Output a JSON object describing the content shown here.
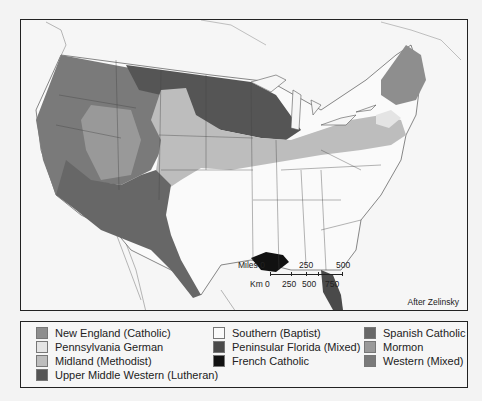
{
  "map": {
    "credit": "After Zelinsky",
    "scale": {
      "miles_label": "Miles 0",
      "miles_ticks": [
        "250",
        "500"
      ],
      "km_label": "Km 0",
      "km_ticks": [
        "250",
        "500",
        "750"
      ]
    }
  },
  "legend": {
    "items": [
      {
        "label": "New England (Catholic)",
        "color": "#8e8e8e"
      },
      {
        "label": "Pennsylvania German",
        "color": "#e4e4e4"
      },
      {
        "label": "Midland (Methodist)",
        "color": "#bdbdbd"
      },
      {
        "label": "Upper Middle Western (Lutheran)",
        "color": "#555555"
      },
      {
        "label": "Southern (Baptist)",
        "color": "#fafafa"
      },
      {
        "label": "Peninsular Florida (Mixed)",
        "color": "#4a4a4a"
      },
      {
        "label": "French Catholic",
        "color": "#111111"
      },
      {
        "label": "Spanish Catholic",
        "color": "#676767"
      },
      {
        "label": "Mormon",
        "color": "#999999"
      },
      {
        "label": "Western (Mixed)",
        "color": "#7a7a7a"
      }
    ]
  }
}
